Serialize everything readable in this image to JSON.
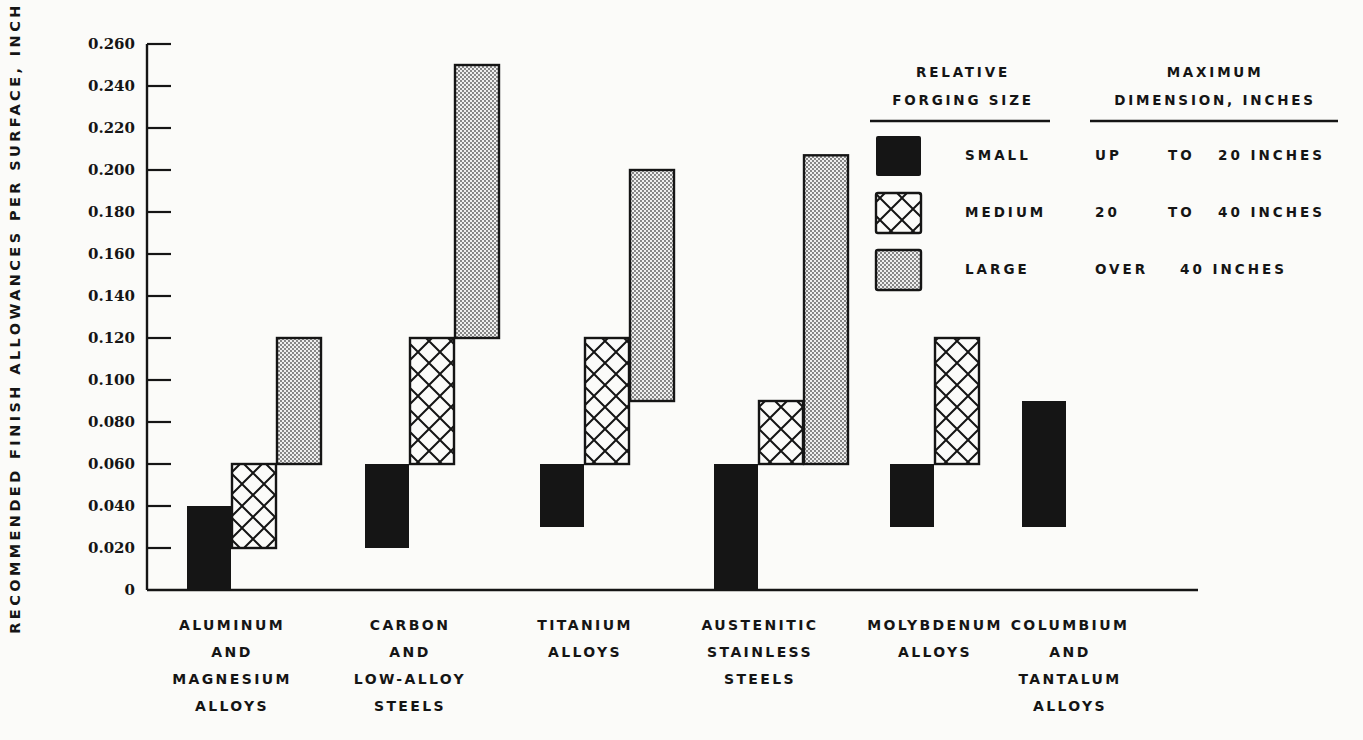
{
  "chart_data": {
    "type": "bar",
    "subtype": "floating-range-bar",
    "title": "",
    "ylabel": "RECOMMENDED FINISH ALLOWANCES PER SURFACE, INCH",
    "xlabel": "",
    "ylim": [
      0,
      0.26
    ],
    "yticks": [
      "0",
      "0.020",
      "0.040",
      "0.060",
      "0.080",
      "0.100",
      "0.120",
      "0.140",
      "0.160",
      "0.180",
      "0.200",
      "0.220",
      "0.240",
      "0.260"
    ],
    "grid": false,
    "legend_position": "top-right",
    "categories": [
      [
        "ALUMINUM",
        "AND",
        "MAGNESIUM",
        "ALLOYS"
      ],
      [
        "CARBON",
        "AND",
        "LOW-ALLOY",
        "STEELS"
      ],
      [
        "TITANIUM",
        "ALLOYS"
      ],
      [
        "AUSTENITIC",
        "STAINLESS",
        "STEELS"
      ],
      [
        "MOLYBDENUM",
        "ALLOYS"
      ],
      [
        "COLUMBIUM",
        "AND",
        "TANTALUM",
        "ALLOYS"
      ]
    ],
    "series": [
      {
        "name": "SMALL",
        "pattern": "solid",
        "ranges": [
          [
            0,
            0.04
          ],
          [
            0.02,
            0.06
          ],
          [
            0.03,
            0.06
          ],
          [
            0,
            0.06
          ],
          [
            0.03,
            0.06
          ],
          [
            0.03,
            0.09
          ]
        ]
      },
      {
        "name": "MEDIUM",
        "pattern": "crosshatch",
        "ranges": [
          [
            0.02,
            0.06
          ],
          [
            0.06,
            0.12
          ],
          [
            0.06,
            0.12
          ],
          [
            0.06,
            0.09
          ],
          [
            0.06,
            0.12
          ],
          null
        ]
      },
      {
        "name": "LARGE",
        "pattern": "stipple",
        "ranges": [
          [
            0.06,
            0.12
          ],
          [
            0.12,
            0.25
          ],
          [
            0.09,
            0.2
          ],
          [
            0.06,
            0.207
          ],
          null,
          null
        ]
      }
    ]
  },
  "legend": {
    "header_size": [
      "RELATIVE",
      "FORGING SIZE"
    ],
    "header_dim": [
      "MAXIMUM",
      "DIMENSION, INCHES"
    ],
    "rows": [
      {
        "size": "SMALL",
        "dim": [
          "UP",
          "TO",
          "20 INCHES"
        ],
        "pattern": "solid"
      },
      {
        "size": "MEDIUM",
        "dim": [
          "20",
          "TO",
          "40 INCHES"
        ],
        "pattern": "crosshatch"
      },
      {
        "size": "LARGE",
        "dim": [
          "OVER",
          "40 INCHES"
        ],
        "pattern": "stipple"
      }
    ]
  },
  "colors": {
    "ink": "#151515",
    "paper": "#fbfbf9",
    "stipple": "#9a9a9a"
  }
}
